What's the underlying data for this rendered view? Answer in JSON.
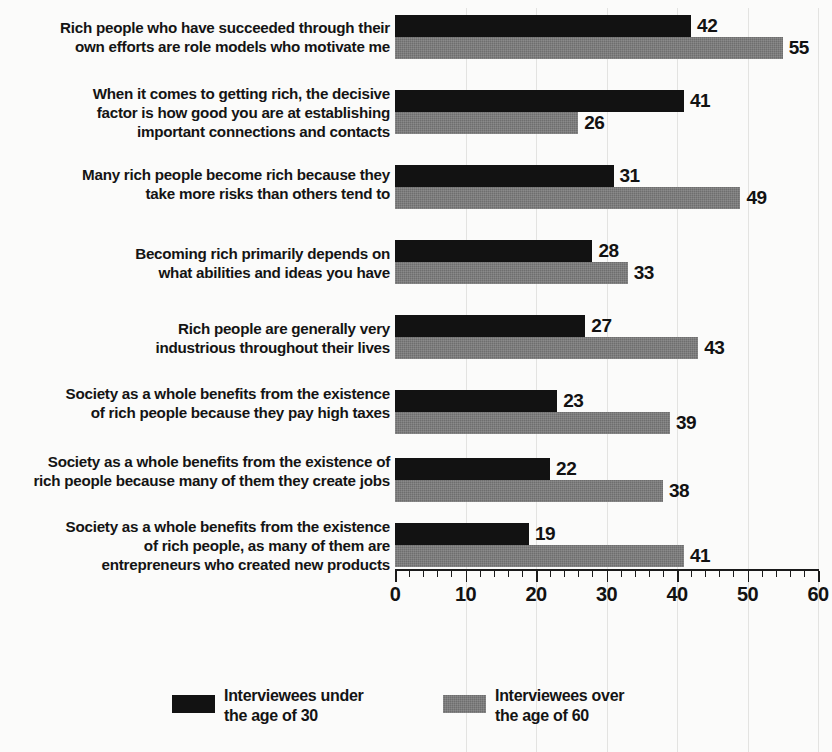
{
  "chart_data": {
    "type": "bar",
    "orientation": "horizontal",
    "title": "",
    "subtitle": "",
    "xlabel": "",
    "ylabel": "",
    "xlim": [
      0,
      60
    ],
    "xticks": [
      0,
      10,
      20,
      30,
      40,
      50,
      60
    ],
    "xtick_labels": [
      "0",
      "10",
      "20",
      "30",
      "40",
      "50",
      "60"
    ],
    "minor_tick_step": 2,
    "grid": true,
    "grid_axis": "x",
    "legend_position": "bottom",
    "categories": [
      "Rich people who have succeeded through their\nown efforts are role models who motivate me",
      "When it comes to getting rich, the decisive\nfactor is how good you are at establishing\nimportant connections and contacts",
      "Many rich people become rich because they\ntake more risks than others tend to",
      "Becoming rich primarily depends on\nwhat abilities and ideas you have",
      "Rich people are generally very\nindustrious throughout their lives",
      "Society as a whole benefits from the existence\nof rich people because they pay high taxes",
      "Society as a whole benefits from the existence of\nrich people because many of them they create jobs",
      "Society as a whole benefits from the existence\nof rich people, as many of them are\nentrepreneurs who created new products"
    ],
    "series": [
      {
        "name": "Interviewees under\nthe age of 30",
        "color": "#121212",
        "values": [
          42,
          41,
          31,
          28,
          27,
          23,
          22,
          19
        ],
        "value_labels": [
          "42",
          "41",
          "31",
          "28",
          "27",
          "23",
          "22",
          "19"
        ]
      },
      {
        "name": "Interviewees over\nthe age of 60",
        "color": "#6e6e6e",
        "values": [
          55,
          26,
          49,
          33,
          43,
          39,
          38,
          41
        ],
        "value_labels": [
          "55",
          "26",
          "49",
          "33",
          "43",
          "39",
          "38",
          "41"
        ]
      }
    ]
  },
  "legend": {
    "items": [
      {
        "label": "Interviewees under\nthe age of 30",
        "color": "#121212"
      },
      {
        "label": "Interviewees over\nthe age of 60",
        "color": "#6e6e6e"
      }
    ]
  },
  "layout": {
    "group_tops": [
      15,
      90,
      165,
      240,
      315,
      390,
      458,
      523
    ],
    "label_tops": [
      18,
      84,
      165,
      244,
      319,
      384,
      452,
      517
    ],
    "legend_lefts": [
      172,
      443
    ],
    "bar_height": 22,
    "plot_left": 395,
    "plot_right": 818,
    "axis_y": 569
  },
  "colors": {
    "background": "#fbfbfa",
    "text": "#121212",
    "grid": "#e3e3e1",
    "axis": "#1a1a1a"
  }
}
